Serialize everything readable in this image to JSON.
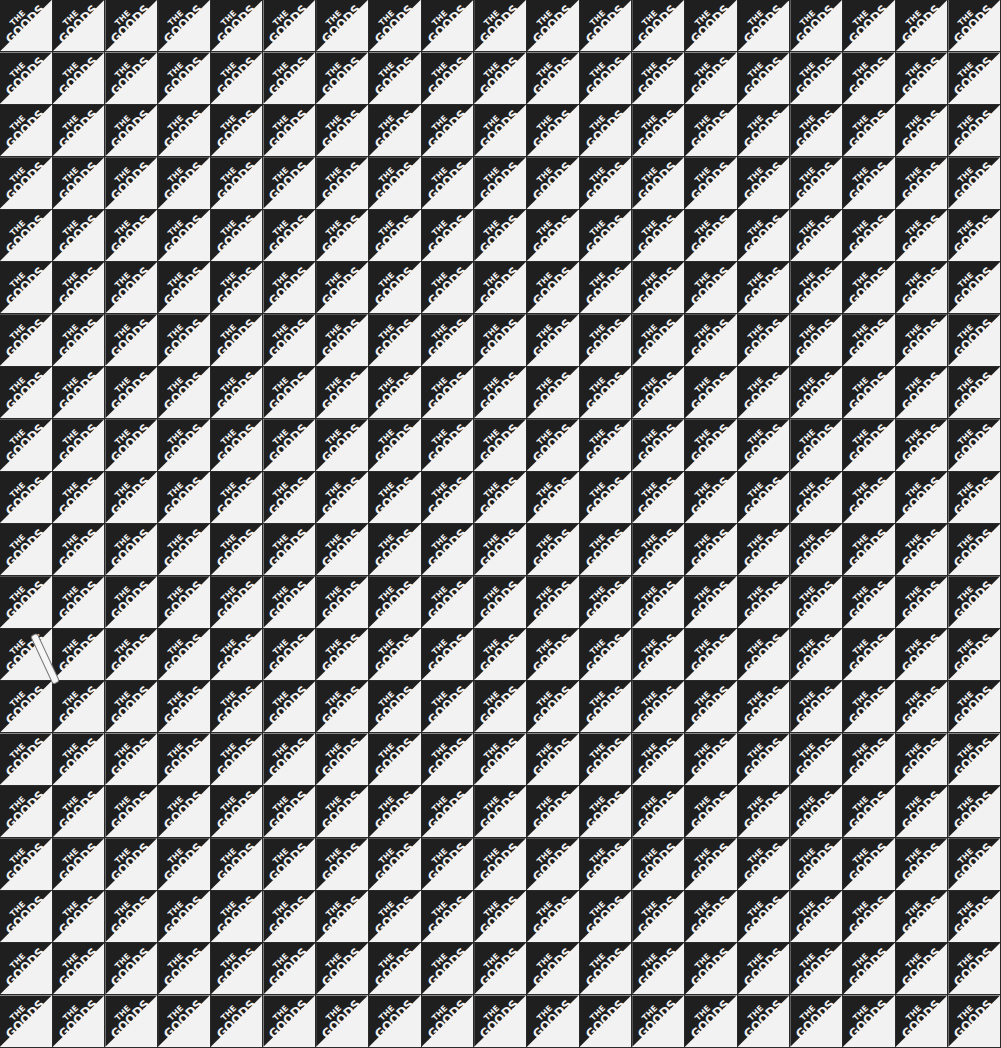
{
  "pattern": {
    "tile_text_line1": "THE",
    "tile_text_line2": "GOODS",
    "columns": 19,
    "rows": 20,
    "colors": {
      "dark": "#1f1f1f",
      "light": "#f2f2f2"
    }
  }
}
